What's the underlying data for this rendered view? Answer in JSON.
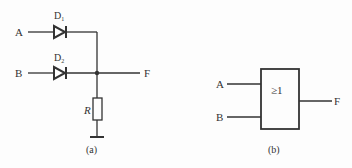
{
  "figure_a": {
    "caption": "(a)",
    "inputs": [
      {
        "name": "A",
        "diode": "D",
        "diode_sub": "1"
      },
      {
        "name": "B",
        "diode": "D",
        "diode_sub": "2"
      }
    ],
    "output": "F",
    "resistor": "R"
  },
  "figure_b": {
    "caption": "(b)",
    "inputs": [
      "A",
      "B"
    ],
    "gate_symbol": "≥1",
    "output": "F"
  },
  "colors": {
    "line": "#333333",
    "background": "#fdfdfd"
  }
}
